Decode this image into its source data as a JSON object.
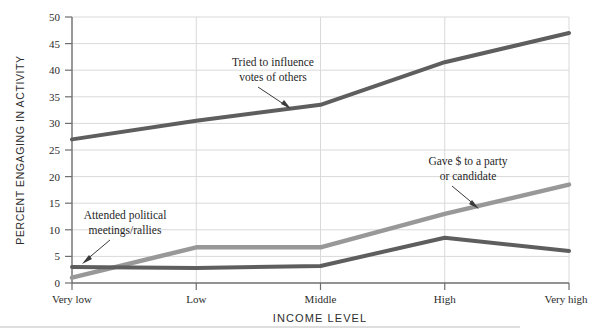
{
  "chart_data": {
    "type": "line",
    "title": "",
    "subtitle": "",
    "xlabel": "INCOME LEVEL",
    "ylabel": "PERCENT ENGAGING IN ACTIVITY",
    "categories": [
      "Very low",
      "Low",
      "Middle",
      "High",
      "Very high"
    ],
    "yticks": [
      0,
      5,
      10,
      15,
      20,
      25,
      30,
      35,
      40,
      45,
      50
    ],
    "ylim": [
      0,
      50
    ],
    "grid": true,
    "legend_position": "inline-annotations",
    "series": [
      {
        "name": "Tried to influence votes of others",
        "color": "#5e5e5e",
        "values": [
          27,
          30.5,
          33.5,
          41.5,
          47
        ]
      },
      {
        "name": "Gave $ to a party or candidate",
        "color": "#989898",
        "values": [
          1,
          6.7,
          6.7,
          13,
          18.5
        ]
      },
      {
        "name": "Attended political meetings/rallies",
        "color": "#5e5e5e",
        "values": [
          3,
          2.8,
          3.2,
          8.5,
          6
        ]
      }
    ],
    "annotations": [
      {
        "id": "anno-influence",
        "lines": [
          "Tried to influence",
          "votes of others"
        ],
        "target_category": "Middle",
        "target_series": "Tried to influence votes of others"
      },
      {
        "id": "anno-gave",
        "lines": [
          "Gave $ to a party",
          "or candidate"
        ],
        "target_category": "High",
        "target_series": "Gave $ to a party or candidate"
      },
      {
        "id": "anno-attended",
        "lines": [
          "Attended political",
          "meetings/rallies"
        ],
        "target_category": "Very low",
        "target_series": "Attended political meetings/rallies"
      }
    ]
  },
  "axes": {
    "y_tick_labels": [
      "50",
      "45",
      "40",
      "35",
      "30",
      "25",
      "20",
      "15",
      "10",
      "5",
      "0"
    ],
    "x_tick_labels": [
      "Very low",
      "Low",
      "Middle",
      "High",
      "Very high"
    ],
    "y_axis_title": "PERCENT ENGAGING IN ACTIVITY",
    "x_axis_title": "INCOME LEVEL"
  },
  "figure": {
    "footer_rule": true
  }
}
